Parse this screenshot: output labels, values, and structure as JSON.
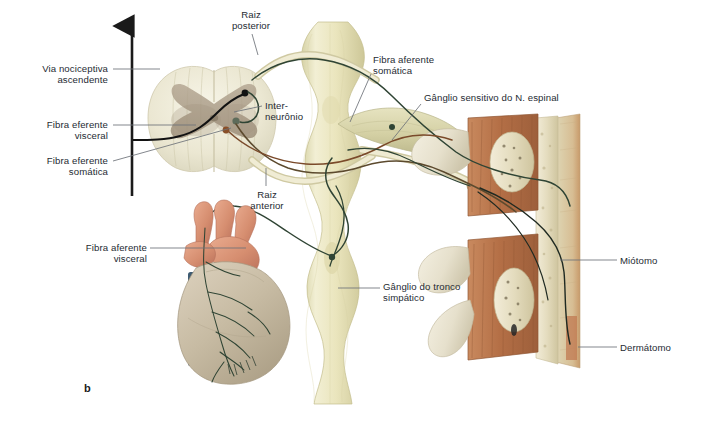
{
  "figure": {
    "panel_letter": "b",
    "background_color": "#ffffff",
    "text_color": "#262b33",
    "leader_color": "#6d7179"
  },
  "labels": [
    {
      "id": "via-nociceptiva-ascendente",
      "text": "Via nociceptiva\nascendente",
      "align": "right",
      "x": 16,
      "y": 63,
      "w": 92
    },
    {
      "id": "fibra-eferente-visceral",
      "text": "Fibra eferente\nvisceral",
      "align": "right",
      "x": 16,
      "y": 119,
      "w": 92
    },
    {
      "id": "fibra-eferente-somatica",
      "text": "Fibra eferente\nsomática",
      "align": "right",
      "x": 16,
      "y": 155,
      "w": 92
    },
    {
      "id": "raiz-posterior",
      "text": "Raiz\nposterior",
      "align": "center",
      "x": 216,
      "y": 9,
      "w": 70
    },
    {
      "id": "raiz-anterior",
      "text": "Raiz\nanterior",
      "align": "center",
      "x": 239,
      "y": 189,
      "w": 56
    },
    {
      "id": "interneuronio",
      "text": "Inter-\nneurônio",
      "align": "left",
      "x": 265,
      "y": 100,
      "w": 60
    },
    {
      "id": "fibra-aferente-somatica",
      "text": "Fibra aferente\nsomática",
      "align": "left",
      "x": 373,
      "y": 54,
      "w": 86
    },
    {
      "id": "ganglio-sensitivo-n-espinal",
      "text": "Gânglio sensitivo do N. espinal",
      "align": "left",
      "x": 424,
      "y": 92,
      "w": 176
    },
    {
      "id": "fibra-aferente-visceral",
      "text": "Fibra aferente\nvisceral",
      "align": "right",
      "x": 55,
      "y": 242,
      "w": 92
    },
    {
      "id": "ganglio-tronco-simpatico",
      "text": "Gânglio do tronco\nsimpático",
      "align": "left",
      "x": 383,
      "y": 281,
      "w": 110
    },
    {
      "id": "miotomo",
      "text": "Miótomo",
      "align": "left",
      "x": 620,
      "y": 255,
      "w": 70
    },
    {
      "id": "dermatomo",
      "text": "Dermátomo",
      "align": "left",
      "x": 620,
      "y": 342,
      "w": 80
    }
  ],
  "leaders": [
    {
      "id": "leader-via-nociceptiva",
      "from": [
        113,
        69
      ],
      "to": [
        160,
        69
      ]
    },
    {
      "id": "leader-fibra-ef-visceral",
      "from": [
        113,
        125
      ],
      "to": [
        196,
        125
      ]
    },
    {
      "id": "leader-fibra-ef-somatica",
      "from": [
        113,
        161
      ],
      "to": [
        231,
        128
      ]
    },
    {
      "id": "leader-raiz-posterior",
      "from": [
        252,
        34
      ],
      "to": [
        258,
        55
      ]
    },
    {
      "id": "leader-raiz-anterior",
      "from": [
        266,
        186
      ],
      "to": [
        266,
        168
      ]
    },
    {
      "id": "leader-interneuronio",
      "from": [
        262,
        106
      ],
      "to": [
        234,
        112
      ]
    },
    {
      "id": "leader-fibra-af-somatica",
      "from": [
        371,
        74
      ],
      "to": [
        350,
        122
      ]
    },
    {
      "id": "leader-ganglio-sensitivo",
      "from": [
        421,
        104
      ],
      "to": [
        392,
        140
      ]
    },
    {
      "id": "leader-fibra-af-visceral",
      "from": [
        150,
        248
      ],
      "to": [
        246,
        248
      ]
    },
    {
      "id": "leader-ganglio-simpatico",
      "from": [
        380,
        288
      ],
      "to": [
        338,
        288
      ]
    },
    {
      "id": "leader-miotomo",
      "from": [
        617,
        260
      ],
      "to": [
        560,
        260
      ]
    },
    {
      "id": "leader-dermatomo",
      "from": [
        617,
        347
      ],
      "to": [
        578,
        347
      ]
    }
  ],
  "structures": {
    "spinal_cord_cross_section": {
      "name": "Medula espinal (corte transversal)",
      "white_matter_color": "#efecd9",
      "gray_matter_color": "#a79884"
    },
    "sympathetic_trunk": {
      "name": "Tronco simpático",
      "color": "#ece7c2"
    },
    "spinal_ganglion": {
      "name": "Gânglio sensitivo do N. espinal",
      "color": "#d9d7b0"
    },
    "heart": {
      "name": "Coração",
      "myocardium_color": "#c9bda6",
      "vessel_color": "#d89176",
      "stump_color": "#3e5b72"
    },
    "vertebrae": {
      "name": "Vértebras com músculo e pele",
      "muscle_color": "#b5724b",
      "bone_color": "#e8e0c4",
      "skin_color": "#d9b98d"
    },
    "nerve_fiber_colors": {
      "afferent_visceral": "#2f4434",
      "efferent_visceral": "#7a4a2a",
      "nociceptive_tract": "#121212",
      "efferent_somatic": "#5c4a2e"
    }
  },
  "ascending_arrow": {
    "id": "via-nociceptiva-arrow",
    "x": 132,
    "y_top": 22,
    "y_bottom": 196,
    "color": "#1a1a1a",
    "direction": "up"
  }
}
